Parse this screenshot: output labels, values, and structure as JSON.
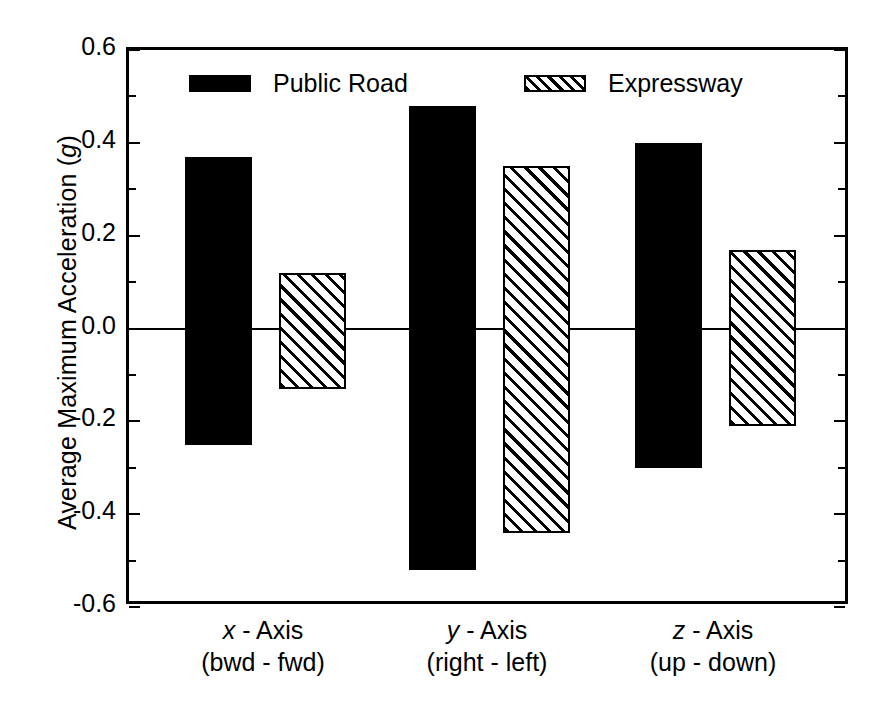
{
  "chart_data": {
    "type": "bar",
    "title": "",
    "subtitle": "",
    "xlabel": "",
    "ylabel": "Average Maximum Acceleration  (g)",
    "ylabel_italic_part": "g",
    "ylim": [
      -0.6,
      0.6
    ],
    "y_major_step": 0.2,
    "y_minor_step": 0.1,
    "grid": false,
    "zero_line": true,
    "legend_position": "inside-top",
    "categories": [
      {
        "line1": "x - Axis",
        "line2": "(bwd - fwd)",
        "italic_letter": "x"
      },
      {
        "line1": "y - Axis",
        "line2": "(right - left)",
        "italic_letter": "y"
      },
      {
        "line1": "z - Axis",
        "line2": "(up - down)",
        "italic_letter": "z"
      }
    ],
    "category_labels": [
      "x - Axis (bwd - fwd)",
      "y - Axis (right - left)",
      "z - Axis (up - down)"
    ],
    "series": [
      {
        "name": "Public Road",
        "style": "solid-black",
        "color": "#000000",
        "positive_values": [
          0.37,
          0.48,
          0.4
        ],
        "negative_values": [
          -0.25,
          -0.52,
          -0.3
        ]
      },
      {
        "name": "Expressway",
        "style": "hatched",
        "color": "#000000",
        "positive_values": [
          0.12,
          0.35,
          0.17
        ],
        "negative_values": [
          -0.13,
          -0.44,
          -0.21
        ]
      }
    ],
    "ytick_labels": [
      "0.6",
      "0.4",
      "0.2",
      "0.0",
      "-0.2",
      "-0.4",
      "-0.6"
    ],
    "ytick_values": [
      0.6,
      0.4,
      0.2,
      0.0,
      -0.2,
      -0.4,
      -0.6
    ]
  },
  "legend": {
    "items": [
      {
        "label": "Public Road",
        "swatch": "solid-black-swatch"
      },
      {
        "label": "Expressway",
        "swatch": "hatched-swatch"
      }
    ]
  },
  "axes": {
    "y_title": "Average Maximum Acceleration  (",
    "y_title_italic": "g",
    "y_title_tail": ")"
  }
}
